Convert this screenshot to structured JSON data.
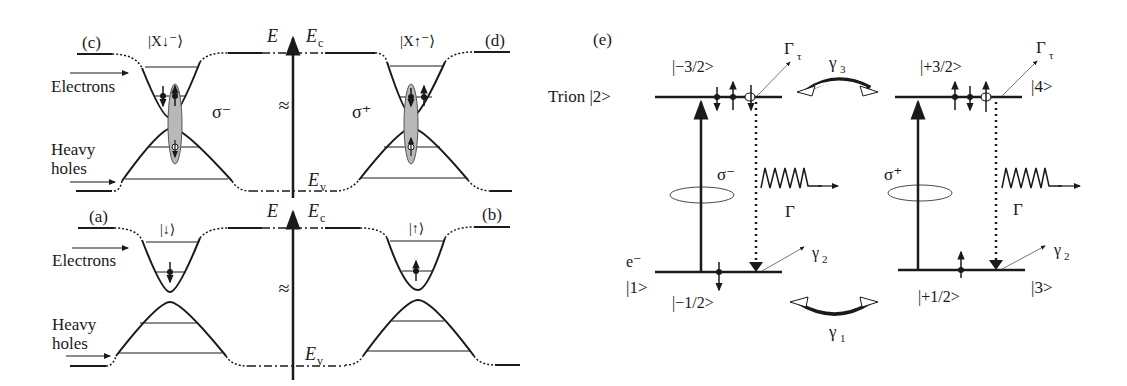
{
  "panels": {
    "c": {
      "tag": "(c)",
      "state": "|X↓⁻⟩",
      "pol": "σ⁻",
      "electrons": "Electrons",
      "heavy": "Heavy",
      "holes": "holes"
    },
    "d": {
      "tag": "(d)",
      "state": "|X↑⁻⟩",
      "pol": "σ⁺"
    },
    "a": {
      "tag": "(a)",
      "state": "|↓⟩",
      "electrons": "Electrons",
      "heavy": "Heavy",
      "holes": "holes"
    },
    "b": {
      "tag": "(b)",
      "state": "|↑⟩"
    },
    "axis": {
      "E": "E",
      "Ec": "E",
      "Ec_sub": "c",
      "Ev": "E",
      "Ev_sub": "v",
      "break": "≈"
    },
    "e": {
      "tag": "(e)",
      "trion": "Trion |2>",
      "state_m32": "|−3/2>",
      "state_p32": "|+3/2>",
      "state_4": "|4>",
      "state_1_e": "e⁻",
      "state_1": "|1>",
      "state_m12": "|−1/2>",
      "state_p12": "|+1/2>",
      "state_3": "|3>",
      "gamma_tau": "Γ",
      "gamma_tau_sub": "τ",
      "gamma3": "γ",
      "gamma3_sub": "3",
      "gamma1": "γ",
      "gamma1_sub": "1",
      "gamma2": "γ",
      "gamma2_sub": "2",
      "Gamma": "Γ",
      "sigma_minus": "σ⁻",
      "sigma_plus": "σ⁺"
    }
  }
}
